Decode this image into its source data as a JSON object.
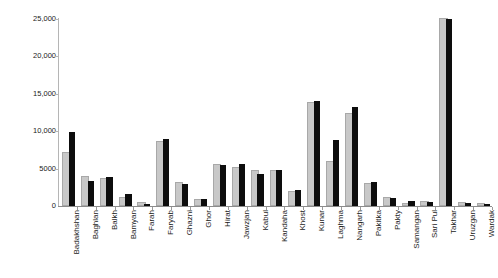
{
  "chart_data": {
    "type": "bar",
    "title": "",
    "xlabel": "",
    "ylabel": "Number of Malaria Cases",
    "ylim": [
      0,
      25000
    ],
    "yticks": [
      0,
      5000,
      10000,
      15000,
      20000,
      25000
    ],
    "ytick_labels": [
      "0",
      "5000",
      "10,000",
      "15,000",
      "20,000",
      "25,000"
    ],
    "grid": false,
    "legend": "none",
    "categories": [
      "Badakhshan",
      "Baghlan",
      "Balkh",
      "Bamyan",
      "Farah",
      "Faryab",
      "Ghazni",
      "Ghor",
      "Hirat",
      "Jawzjan",
      "Kabul",
      "Kandaha",
      "Khost",
      "Kunar",
      "Laghma",
      "Nangarh",
      "Pakitka",
      "Pakty",
      "Samangan",
      "Sari Pul",
      "Takhar",
      "Uruzgan",
      "Wardak"
    ],
    "series": [
      {
        "name": "light",
        "color": "#c8c8c8",
        "values": [
          6900,
          3800,
          3500,
          900,
          250,
          8400,
          2900,
          700,
          5300,
          5000,
          4500,
          4500,
          1800,
          13700,
          5700,
          12200,
          2800,
          1000,
          150,
          400,
          24900,
          300,
          200
        ]
      },
      {
        "name": "dark",
        "color": "#0d0d0d",
        "values": [
          9900,
          3300,
          3900,
          1600,
          300,
          8900,
          2900,
          1000,
          5500,
          5600,
          4300,
          4800,
          2100,
          14100,
          8800,
          13300,
          3200,
          1100,
          700,
          500,
          25000,
          400,
          300
        ]
      }
    ]
  }
}
